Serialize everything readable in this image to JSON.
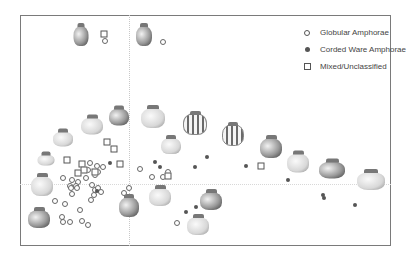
{
  "chart_data": {
    "type": "scatter",
    "title": "",
    "xlabel": "",
    "ylabel": "",
    "grid": false,
    "legend_position": "top-right",
    "legend": [
      {
        "label": "Globular Amphorae",
        "marker": "open-circle"
      },
      {
        "label": "Corded Ware Amphorae",
        "marker": "filled-circle"
      },
      {
        "label": "Mixed/Unclassified",
        "marker": "open-square"
      }
    ],
    "series": [
      {
        "name": "Globular Amphorae",
        "marker": "open-circle",
        "points_px": [
          [
            105,
            41
          ],
          [
            163,
            42
          ],
          [
            140,
            169
          ],
          [
            152,
            177
          ],
          [
            168,
            172
          ],
          [
            163,
            177
          ],
          [
            90,
            163
          ],
          [
            97,
            166
          ],
          [
            103,
            167
          ],
          [
            88,
            170
          ],
          [
            95,
            175
          ],
          [
            98,
            172
          ],
          [
            63,
            178
          ],
          [
            72,
            180
          ],
          [
            78,
            182
          ],
          [
            70,
            186
          ],
          [
            76,
            186
          ],
          [
            86,
            178
          ],
          [
            71,
            188
          ],
          [
            77,
            188
          ],
          [
            72,
            194
          ],
          [
            92,
            185
          ],
          [
            95,
            190
          ],
          [
            98,
            188
          ],
          [
            101,
            192
          ],
          [
            94,
            195
          ],
          [
            91,
            200
          ],
          [
            129,
            188
          ],
          [
            124,
            193
          ],
          [
            55,
            201
          ],
          [
            65,
            204
          ],
          [
            80,
            210
          ],
          [
            62,
            217
          ],
          [
            63,
            222
          ],
          [
            70,
            222
          ],
          [
            82,
            221
          ],
          [
            88,
            225
          ],
          [
            177,
            223
          ]
        ]
      },
      {
        "name": "Corded Ware Amphorae",
        "marker": "filled-circle",
        "points_px": [
          [
            110,
            163
          ],
          [
            155,
            162
          ],
          [
            160,
            167
          ],
          [
            195,
            167
          ],
          [
            207,
            157
          ],
          [
            246,
            166
          ],
          [
            288,
            180
          ],
          [
            323,
            195
          ],
          [
            324,
            198
          ],
          [
            355,
            205
          ],
          [
            97,
            191
          ],
          [
            186,
            212
          ],
          [
            196,
            207
          ]
        ]
      },
      {
        "name": "Mixed/Unclassified",
        "marker": "open-square",
        "points_px": [
          [
            104,
            34
          ],
          [
            67,
            160
          ],
          [
            82,
            164
          ],
          [
            84,
            170
          ],
          [
            78,
            173
          ],
          [
            95,
            172
          ],
          [
            107,
            142
          ],
          [
            114,
            149
          ],
          [
            120,
            164
          ],
          [
            168,
            176
          ],
          [
            261,
            166
          ]
        ]
      }
    ],
    "vessel_illustrations": [
      {
        "x": 81,
        "y": 36,
        "w": 15,
        "h": 20,
        "style": "dark"
      },
      {
        "x": 144,
        "y": 36,
        "w": 16,
        "h": 20,
        "style": "dark"
      },
      {
        "x": 119,
        "y": 117,
        "w": 20,
        "h": 17,
        "style": "dark"
      },
      {
        "x": 153,
        "y": 118,
        "w": 24,
        "h": 20,
        "style": "light"
      },
      {
        "x": 195,
        "y": 124,
        "w": 22,
        "h": 20,
        "style": "striped"
      },
      {
        "x": 233,
        "y": 135,
        "w": 20,
        "h": 20,
        "style": "striped"
      },
      {
        "x": 271,
        "y": 148,
        "w": 22,
        "h": 20,
        "style": "dark"
      },
      {
        "x": 92,
        "y": 126,
        "w": 22,
        "h": 17,
        "style": "light"
      },
      {
        "x": 63,
        "y": 139,
        "w": 20,
        "h": 15,
        "style": "light"
      },
      {
        "x": 46,
        "y": 160,
        "w": 17,
        "h": 11,
        "style": "light"
      },
      {
        "x": 42,
        "y": 186,
        "w": 22,
        "h": 20,
        "style": "light"
      },
      {
        "x": 171,
        "y": 146,
        "w": 20,
        "h": 16,
        "style": "light"
      },
      {
        "x": 160,
        "y": 197,
        "w": 22,
        "h": 18,
        "style": "light"
      },
      {
        "x": 129,
        "y": 207,
        "w": 20,
        "h": 20,
        "style": "dark"
      },
      {
        "x": 211,
        "y": 201,
        "w": 22,
        "h": 18,
        "style": "dark"
      },
      {
        "x": 198,
        "y": 226,
        "w": 22,
        "h": 18,
        "style": "light"
      },
      {
        "x": 39,
        "y": 219,
        "w": 22,
        "h": 18,
        "style": "dark"
      },
      {
        "x": 298,
        "y": 163,
        "w": 22,
        "h": 19,
        "style": "light"
      },
      {
        "x": 332,
        "y": 170,
        "w": 26,
        "h": 17,
        "style": "dark"
      },
      {
        "x": 371,
        "y": 181,
        "w": 28,
        "h": 18,
        "style": "light"
      }
    ],
    "frame_px": {
      "left": 20,
      "top": 15,
      "right": 391,
      "bottom": 246
    },
    "axes_origin_px": {
      "x": 129,
      "y": 184
    }
  }
}
